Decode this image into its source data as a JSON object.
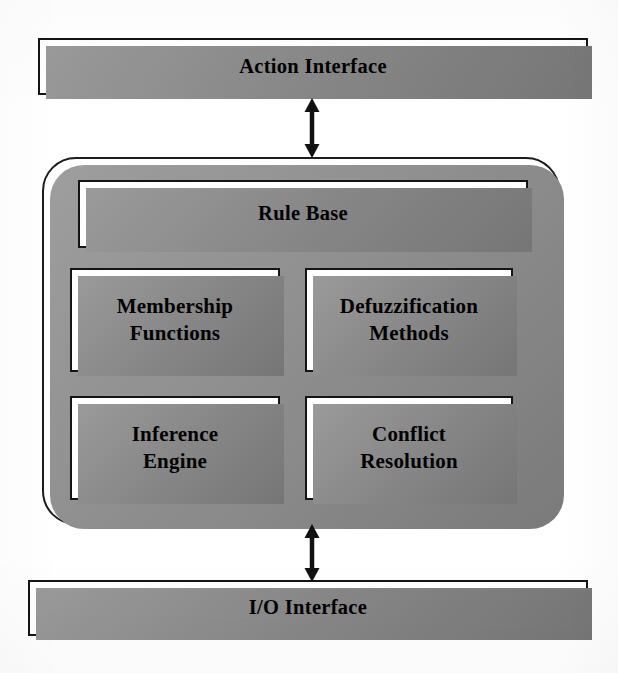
{
  "diagram": {
    "background_color": "#ffffff",
    "line_color": "#141414",
    "shadow_color": "#8a8a8a",
    "text_color": "#000000"
  },
  "top_bar": {
    "label": "Action Interface"
  },
  "bottom_bar": {
    "label": "I/O Interface"
  },
  "engine": {
    "rule_base": {
      "label": "Rule Base"
    },
    "cells": [
      {
        "id": "membership-functions",
        "line1": "Membership",
        "line2": "Functions"
      },
      {
        "id": "defuzzification-methods",
        "line1": "Defuzzification",
        "line2": "Methods"
      },
      {
        "id": "inference-engine",
        "line1": "Inference",
        "line2": "Engine"
      },
      {
        "id": "conflict-resolution",
        "line1": "Conflict",
        "line2": "Resolution"
      }
    ]
  },
  "connectors": [
    {
      "id": "top-connector",
      "from": "Action Interface",
      "to": "Engine",
      "style": "double-headed-arrow",
      "direction": "bidirectional"
    },
    {
      "id": "bottom-connector",
      "from": "Engine",
      "to": "I/O Interface",
      "style": "double-headed-arrow",
      "direction": "bidirectional"
    }
  ]
}
